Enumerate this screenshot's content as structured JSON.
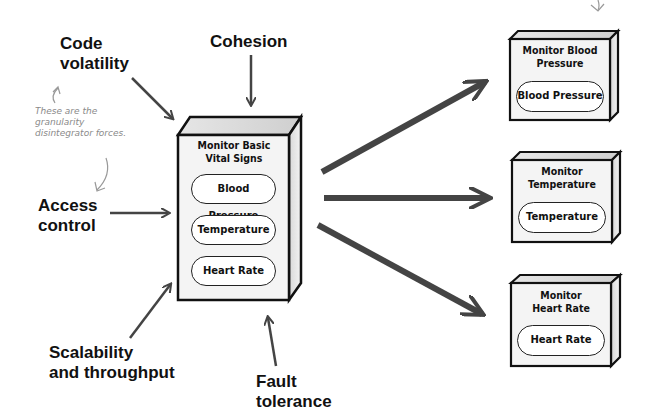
{
  "forces": {
    "code_volatility": "Code\nvolatility",
    "cohesion": "Cohesion",
    "access_control": "Access\ncontrol",
    "scalability": "Scalability\nand throughput",
    "fault_tolerance": "Fault\ntolerance"
  },
  "note": "These are the\ngranularity\ndisintegrator forces.",
  "main_service": {
    "title": "Monitor Basic\nVital Signs",
    "components": [
      "Blood Pressure",
      "Temperature",
      "Heart Rate"
    ]
  },
  "split_services": [
    {
      "title": "Monitor Blood\nPressure",
      "component": "Blood Pressure"
    },
    {
      "title": "Monitor\nTemperature",
      "component": "Temperature"
    },
    {
      "title": "Monitor\nHeart Rate",
      "component": "Heart Rate"
    }
  ],
  "colors": {
    "arrow": "#444444",
    "box_fill": "#f2f2f2",
    "box_side": "#d9d9d9",
    "note": "#8a8a8a"
  }
}
